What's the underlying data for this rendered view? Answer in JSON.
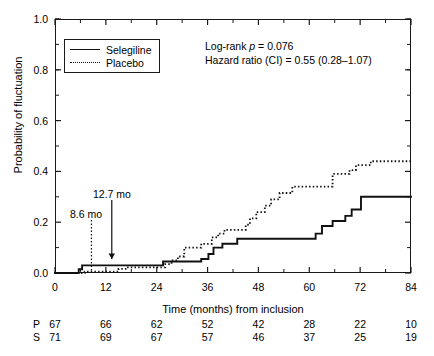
{
  "chart_data": {
    "type": "line",
    "title": "",
    "xlabel": "Time (months) from inclusion",
    "ylabel": "Probability of fluctuation",
    "xlim": [
      0,
      84
    ],
    "ylim": [
      0,
      1.0
    ],
    "xticks": [
      0,
      12,
      24,
      36,
      48,
      60,
      72,
      84
    ],
    "xtick_labels": [
      "0",
      "12",
      "24",
      "36",
      "48",
      "60",
      "72",
      "84"
    ],
    "yticks": [
      0.0,
      0.2,
      0.4,
      0.6,
      0.8,
      1.0
    ],
    "ytick_labels": [
      "0.0",
      "0.2",
      "0.4",
      "0.6",
      "0.8",
      "1.0"
    ],
    "minor_xtick_interval": 6,
    "minor_ytick_interval": 0.1,
    "grid": false,
    "legend_position": "upper-left",
    "series": [
      {
        "name": "Selegiline",
        "style": "solid",
        "color": "#111111",
        "points": [
          [
            0,
            0.0
          ],
          [
            5.6,
            0.0
          ],
          [
            5.6,
            0.015
          ],
          [
            6.4,
            0.015
          ],
          [
            6.4,
            0.03
          ],
          [
            25.5,
            0.03
          ],
          [
            25.5,
            0.045
          ],
          [
            34.5,
            0.045
          ],
          [
            34.5,
            0.055
          ],
          [
            36.2,
            0.055
          ],
          [
            36.2,
            0.075
          ],
          [
            37.4,
            0.075
          ],
          [
            37.4,
            0.1
          ],
          [
            39.5,
            0.1
          ],
          [
            39.5,
            0.115
          ],
          [
            43.0,
            0.115
          ],
          [
            43.0,
            0.135
          ],
          [
            61.5,
            0.135
          ],
          [
            61.5,
            0.155
          ],
          [
            63.0,
            0.155
          ],
          [
            63.0,
            0.185
          ],
          [
            65.5,
            0.185
          ],
          [
            65.5,
            0.205
          ],
          [
            68.5,
            0.205
          ],
          [
            68.5,
            0.225
          ],
          [
            70.0,
            0.225
          ],
          [
            70.0,
            0.25
          ],
          [
            72.2,
            0.25
          ],
          [
            72.2,
            0.3
          ],
          [
            84,
            0.3
          ]
        ]
      },
      {
        "name": "Placebo",
        "style": "dotted",
        "color": "#111111",
        "points": [
          [
            0,
            0.0
          ],
          [
            7.0,
            0.0
          ],
          [
            7.0,
            0.005
          ],
          [
            15.0,
            0.005
          ],
          [
            15.0,
            0.016
          ],
          [
            17.0,
            0.016
          ],
          [
            17.0,
            0.022
          ],
          [
            26.0,
            0.022
          ],
          [
            26.0,
            0.035
          ],
          [
            27.5,
            0.035
          ],
          [
            27.5,
            0.05
          ],
          [
            29.0,
            0.05
          ],
          [
            29.0,
            0.065
          ],
          [
            30.5,
            0.065
          ],
          [
            30.5,
            0.1
          ],
          [
            34.5,
            0.1
          ],
          [
            34.5,
            0.115
          ],
          [
            37.0,
            0.115
          ],
          [
            37.0,
            0.14
          ],
          [
            38.5,
            0.14
          ],
          [
            38.5,
            0.155
          ],
          [
            40.0,
            0.155
          ],
          [
            40.0,
            0.17
          ],
          [
            45.0,
            0.17
          ],
          [
            45.0,
            0.19
          ],
          [
            46.0,
            0.19
          ],
          [
            46.0,
            0.215
          ],
          [
            47.5,
            0.215
          ],
          [
            47.5,
            0.24
          ],
          [
            49.5,
            0.24
          ],
          [
            49.5,
            0.265
          ],
          [
            51.0,
            0.265
          ],
          [
            51.0,
            0.29
          ],
          [
            53.0,
            0.29
          ],
          [
            53.0,
            0.315
          ],
          [
            56.0,
            0.315
          ],
          [
            56.0,
            0.34
          ],
          [
            65.5,
            0.34
          ],
          [
            65.5,
            0.39
          ],
          [
            69.5,
            0.39
          ],
          [
            69.5,
            0.405
          ],
          [
            71.0,
            0.405
          ],
          [
            71.0,
            0.425
          ],
          [
            74.5,
            0.425
          ],
          [
            74.5,
            0.44
          ],
          [
            84,
            0.44
          ]
        ]
      }
    ],
    "annotations": [
      {
        "name": "median-placebo",
        "label": "8.6 mo",
        "x": 8.6,
        "style": "dotted"
      },
      {
        "name": "median-selegiline",
        "label": "12.7 mo",
        "x": 13.4,
        "style": "solid"
      }
    ],
    "stats": {
      "logrank_prefix": "Log-rank ",
      "logrank_italic": "p",
      "logrank_value": " = 0.076",
      "hazard": "Hazard ratio (CI) = 0.55 (0.28–1.07)"
    },
    "risk_table": {
      "times": [
        0,
        12,
        24,
        36,
        48,
        60,
        72,
        84
      ],
      "rows": [
        {
          "tag": "P",
          "name": "Placebo",
          "values": [
            "67",
            "66",
            "62",
            "52",
            "42",
            "28",
            "22",
            "10"
          ]
        },
        {
          "tag": "S",
          "name": "Selegiline",
          "values": [
            "71",
            "69",
            "67",
            "57",
            "46",
            "37",
            "25",
            "19"
          ]
        }
      ]
    }
  }
}
